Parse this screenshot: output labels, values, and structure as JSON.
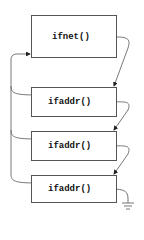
{
  "diagram": {
    "nodes": [
      {
        "id": "ifnet",
        "label": "ifnet()"
      },
      {
        "id": "ifaddr1",
        "label": "ifaddr()"
      },
      {
        "id": "ifaddr2",
        "label": "ifaddr()"
      },
      {
        "id": "ifaddr3",
        "label": "ifaddr()"
      }
    ],
    "edges": [
      {
        "from": "ifnet",
        "to": "ifaddr1",
        "type": "next-pointer"
      },
      {
        "from": "ifaddr1",
        "to": "ifaddr2",
        "type": "next-pointer"
      },
      {
        "from": "ifaddr2",
        "to": "ifaddr3",
        "type": "next-pointer"
      },
      {
        "from": "ifaddr1",
        "to": "ifnet",
        "type": "back-pointer"
      },
      {
        "from": "ifaddr2",
        "to": "ifnet",
        "type": "back-pointer"
      },
      {
        "from": "ifaddr3",
        "to": "ifnet",
        "type": "back-pointer"
      },
      {
        "from": "ifaddr3",
        "to": "null",
        "type": "ground-terminator"
      }
    ],
    "colors": {
      "stroke": "#555555",
      "text": "#111111",
      "background": "#ffffff"
    }
  }
}
